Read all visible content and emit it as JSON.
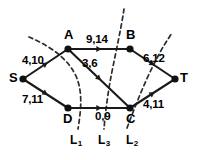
{
  "figure": {
    "kind": "network-flow-cut-diagram",
    "width": 199,
    "height": 160,
    "background_color": "#ffffff",
    "ink_color": "#1a1a1a"
  },
  "nodes": [
    {
      "id": "S",
      "label": "S",
      "x": 23,
      "y": 79,
      "role": "source",
      "label_dx": -14,
      "label_dy": -8
    },
    {
      "id": "A",
      "label": "A",
      "x": 68,
      "y": 49,
      "role": "intermediate",
      "label_dx": -4,
      "label_dy": -21
    },
    {
      "id": "B",
      "label": "B",
      "x": 130,
      "y": 49,
      "role": "intermediate",
      "label_dx": -4,
      "label_dy": -21
    },
    {
      "id": "D",
      "label": "D",
      "x": 68,
      "y": 108,
      "role": "intermediate",
      "label_dx": -5,
      "label_dy": 4
    },
    {
      "id": "C",
      "label": "C",
      "x": 130,
      "y": 108,
      "role": "intermediate",
      "label_dx": -4,
      "label_dy": 4
    },
    {
      "id": "T",
      "label": "T",
      "x": 175,
      "y": 79,
      "role": "sink",
      "label_dx": 5,
      "label_dy": -8
    }
  ],
  "edges": [
    {
      "id": "S-A",
      "from": "S",
      "to": "A",
      "label": "4,10",
      "flow": 4,
      "capacity": 10,
      "label_x": 22,
      "label_y": 55
    },
    {
      "id": "S-D",
      "from": "S",
      "to": "D",
      "label": "7,11",
      "flow": 7,
      "capacity": 11,
      "label_x": 22,
      "label_y": 94
    },
    {
      "id": "A-B",
      "from": "A",
      "to": "B",
      "label": "9,14",
      "flow": 9,
      "capacity": 14,
      "label_x": 86,
      "label_y": 34
    },
    {
      "id": "A-C",
      "from": "A",
      "to": "C",
      "label": "3,6",
      "flow": 3,
      "capacity": 6,
      "label_x": 82,
      "label_y": 58
    },
    {
      "id": "B-T",
      "from": "B",
      "to": "T",
      "label": "6,12",
      "flow": 6,
      "capacity": 12,
      "label_x": 143,
      "label_y": 53
    },
    {
      "id": "D-C",
      "from": "D",
      "to": "C",
      "label": "0,9",
      "flow": 0,
      "capacity": 9,
      "label_x": 95,
      "label_y": 111
    },
    {
      "id": "C-T",
      "from": "C",
      "to": "T",
      "label": "4,11",
      "flow": 4,
      "capacity": 11,
      "label_x": 143,
      "label_y": 99
    }
  ],
  "cuts": [
    {
      "id": "L1",
      "label": "L",
      "subscript": "1",
      "path": "M 29 37 C 45 44, 66 55, 76 76 C 83 92, 81 110, 78 129",
      "label_x": 70,
      "label_y": 134
    },
    {
      "id": "L3",
      "label": "L",
      "subscript": "3",
      "path": "M 124 9 C 121 30, 114 60, 110 82 C 107 100, 105 116, 104 129",
      "label_x": 98,
      "label_y": 134
    },
    {
      "id": "L2",
      "label": "L",
      "subscript": "2",
      "path": "M 127 128 C 133 112, 144 83, 155 62 C 162 48, 168 39, 172 33",
      "label_x": 126,
      "label_y": 134
    }
  ]
}
